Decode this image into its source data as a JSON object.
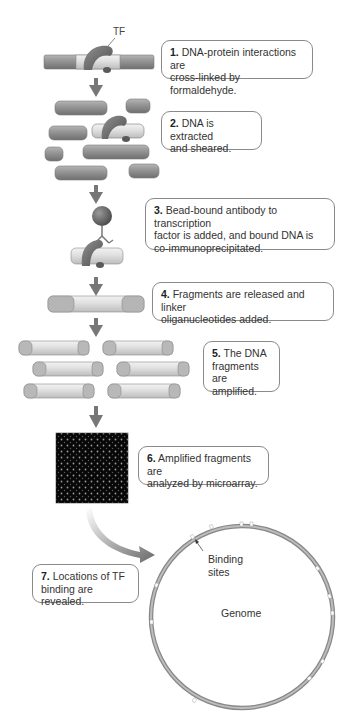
{
  "colors": {
    "dna_dark": "#8c8c8c",
    "dna_light": "#dedede",
    "tf_protein": "#6e6e6e",
    "arrow": "#777777",
    "box_border": "#8a8a8a",
    "microarray_bg": "#0a0a0a"
  },
  "labels": {
    "tf": "TF",
    "binding_sites": "Binding sites",
    "binding_line1": "Binding",
    "binding_line2": "sites",
    "genome": "Genome"
  },
  "steps": [
    {
      "num": "1.",
      "text": "DNA-protein interactions are cross-linked by formaldehyde.",
      "line1": "DNA-protein interactions are",
      "line2": "cross-linked by formaldehyde."
    },
    {
      "num": "2.",
      "text": "DNA is extracted and sheared.",
      "line1": "DNA is extracted",
      "line2": "and sheared."
    },
    {
      "num": "3.",
      "text": "Bead-bound antibody to transcription factor is added, and bound DNA is co-immunoprecipitated.",
      "line1": "Bead-bound antibody to transcription",
      "line2": "factor is added, and bound DNA is",
      "line3": "co-immunoprecipitated."
    },
    {
      "num": "4.",
      "text": "Fragments are released and linker oliganucleotides added.",
      "line1": "Fragments are released and linker",
      "line2": "oliganucleotides added."
    },
    {
      "num": "5.",
      "text": "The DNA fragments are amplified.",
      "line1": "The DNA",
      "line2": "fragments are",
      "line3": "amplified."
    },
    {
      "num": "6.",
      "text": "Amplified fragments are analyzed by microarray.",
      "line1": "Amplified fragments are",
      "line2": "analyzed by microarray."
    },
    {
      "num": "7.",
      "text": "Locations of TF binding are revealed.",
      "line1": "Locations of TF",
      "line2": "binding are revealed."
    }
  ]
}
